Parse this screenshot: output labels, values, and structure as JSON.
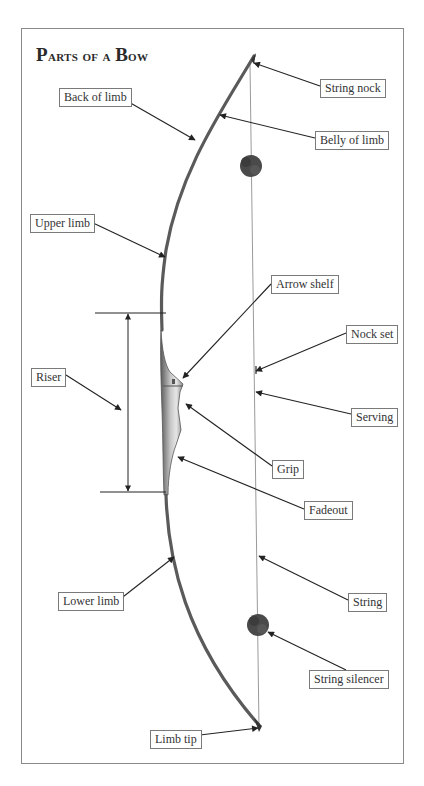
{
  "title": "Parts of a Bow",
  "colors": {
    "frame": "#8a8a8a",
    "bow": "#555555",
    "riser_light": "#b8b8b8",
    "string": "#9a9a9a",
    "arrow": "#222222",
    "silencer": "#4a4a4a",
    "label_border": "#7a7a7a",
    "text": "#333333"
  },
  "labels": [
    {
      "id": "string-nock",
      "text": "String nock",
      "x": 320,
      "y": 79,
      "w": 62,
      "target": [
        254,
        63
      ],
      "from": [
        320,
        86
      ]
    },
    {
      "id": "back-of-limb",
      "text": "Back of limb",
      "x": 59,
      "y": 88,
      "w": 61,
      "target": [
        195,
        140
      ],
      "from": [
        120,
        97
      ]
    },
    {
      "id": "belly-of-limb",
      "text": "Belly of limb",
      "x": 315,
      "y": 131,
      "w": 64,
      "target": [
        220,
        115
      ],
      "from": [
        315,
        138
      ]
    },
    {
      "id": "upper-limb",
      "text": "Upper limb",
      "x": 30,
      "y": 214,
      "w": 61,
      "target": [
        165,
        257
      ],
      "from": [
        91,
        222
      ]
    },
    {
      "id": "arrow-shelf",
      "text": "Arrow shelf",
      "x": 271,
      "y": 275,
      "w": 62,
      "target": [
        183,
        378
      ],
      "from": [
        271,
        284
      ]
    },
    {
      "id": "nock-set",
      "text": "Nock set",
      "x": 346,
      "y": 325,
      "w": 46,
      "target": [
        256,
        371
      ],
      "from": [
        346,
        333
      ]
    },
    {
      "id": "riser",
      "text": "Riser",
      "x": 31,
      "y": 368,
      "w": 35,
      "target": [
        121,
        410
      ],
      "from": [
        66,
        375
      ]
    },
    {
      "id": "serving",
      "text": "Serving",
      "x": 351,
      "y": 408,
      "w": 45,
      "target": [
        256,
        392
      ],
      "from": [
        351,
        414
      ]
    },
    {
      "id": "grip",
      "text": "Grip",
      "x": 272,
      "y": 460,
      "w": 30,
      "target": [
        186,
        404
      ],
      "from": [
        272,
        466
      ]
    },
    {
      "id": "fadeout",
      "text": "Fadeout",
      "x": 304,
      "y": 501,
      "w": 46,
      "target": [
        178,
        457
      ],
      "from": [
        304,
        509
      ]
    },
    {
      "id": "lower-limb",
      "text": "Lower limb",
      "x": 58,
      "y": 592,
      "w": 61,
      "target": [
        174,
        557
      ],
      "from": [
        119,
        600
      ]
    },
    {
      "id": "string",
      "text": "String",
      "x": 348,
      "y": 593,
      "w": 36,
      "target": [
        259,
        556
      ],
      "from": [
        348,
        600
      ]
    },
    {
      "id": "string-silencer",
      "text": "String silencer",
      "x": 309,
      "y": 670,
      "w": 70,
      "target": [
        268,
        632
      ],
      "from": [
        346,
        670
      ]
    },
    {
      "id": "limb-tip",
      "text": "Limb tip",
      "x": 150,
      "y": 730,
      "w": 50,
      "target": [
        258,
        728
      ],
      "from": [
        200,
        735
      ]
    }
  ],
  "riser_span": {
    "top_y": 313,
    "bottom_y": 492,
    "line_x1_top": 95,
    "line_x1_bottom": 100,
    "line_x2": 166,
    "arrow_x": 128
  }
}
